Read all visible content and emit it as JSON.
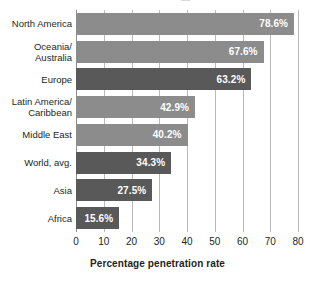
{
  "chart_data": {
    "type": "bar",
    "orientation": "horizontal",
    "title": "",
    "xlabel": "Percentage penetration rate",
    "ylabel": "",
    "xlim": [
      0,
      80
    ],
    "xticks": [
      0,
      10,
      20,
      30,
      40,
      50,
      60,
      70,
      80
    ],
    "grid": true,
    "legend": false,
    "categories": [
      "North America",
      "Oceania/\nAustralia",
      "Europe",
      "Latin America/\nCaribbean",
      "Middle East",
      "World, avg.",
      "Asia",
      "Africa"
    ],
    "values": [
      78.6,
      67.6,
      63.2,
      42.9,
      40.2,
      34.3,
      27.5,
      15.6
    ],
    "value_labels": [
      "78.6%",
      "67.6%",
      "63.2%",
      "42.9%",
      "40.2%",
      "34.3%",
      "27.5%",
      "15.6%"
    ],
    "bar_colors": [
      "#8c8c8c",
      "#8c8c8c",
      "#595959",
      "#8c8c8c",
      "#8c8c8c",
      "#595959",
      "#595959",
      "#595959"
    ]
  },
  "axis": {
    "tick_labels": [
      "0",
      "10",
      "20",
      "30",
      "40",
      "50",
      "60",
      "70",
      "80"
    ],
    "x_axis_title": "Percentage penetration rate"
  },
  "colors": {
    "background": "#ffffff",
    "gridline": "#b9b9b9",
    "axis_line": "#8e8e8e",
    "bar_light": "#8c8c8c",
    "bar_dark": "#595959",
    "value_label": "#ffffff",
    "text": "#231f20"
  },
  "cropped_title_sliver": "—"
}
